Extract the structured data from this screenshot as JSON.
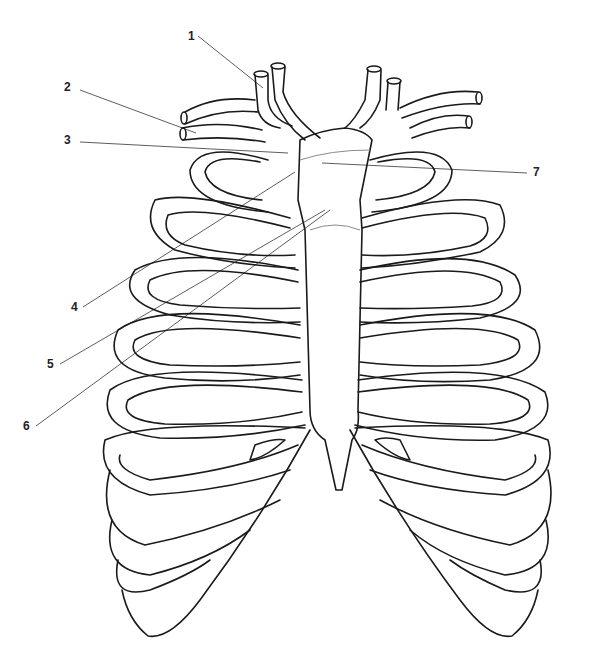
{
  "diagram": {
    "labels": [
      {
        "id": "1",
        "text": "1",
        "x": 190,
        "y": 36
      },
      {
        "id": "2",
        "text": "2",
        "x": 66,
        "y": 87
      },
      {
        "id": "3",
        "text": "3",
        "x": 66,
        "y": 140
      },
      {
        "id": "4",
        "text": "4",
        "x": 73,
        "y": 307
      },
      {
        "id": "5",
        "text": "5",
        "x": 49,
        "y": 364
      },
      {
        "id": "6",
        "text": "6",
        "x": 25,
        "y": 426
      },
      {
        "id": "7",
        "text": "7",
        "x": 533,
        "y": 172
      }
    ]
  }
}
